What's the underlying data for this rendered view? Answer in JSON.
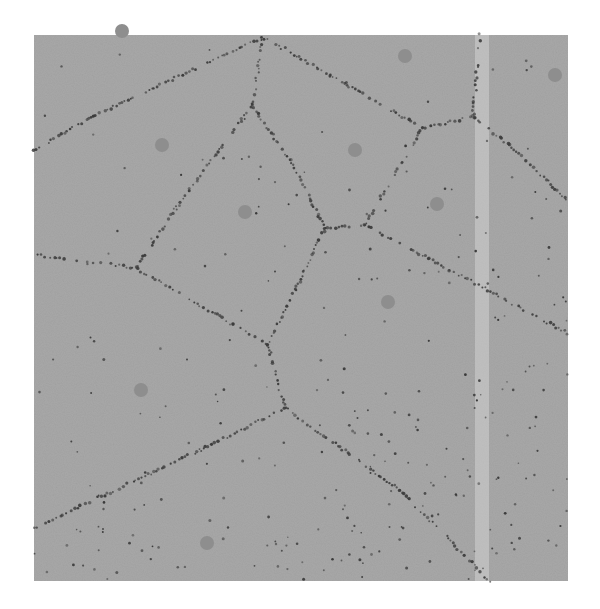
{
  "diagram": {
    "type": "voronoi",
    "background": "#ffffff",
    "panel": {
      "x": 34,
      "y": 35,
      "width": 534,
      "height": 546,
      "fill": "#a8a8a8"
    },
    "edge_color": "#3c3c3c",
    "site_color": "#8e8e8e",
    "site_radius": 7,
    "streak": {
      "x": 475,
      "width": 14,
      "color": "#d2d2d2"
    },
    "sites": [
      [
        122,
        31
      ],
      [
        162,
        145
      ],
      [
        245,
        212
      ],
      [
        355,
        150
      ],
      [
        405,
        56
      ],
      [
        555,
        75
      ],
      [
        437,
        204
      ],
      [
        388,
        302
      ],
      [
        141,
        390
      ],
      [
        207,
        543
      ]
    ],
    "edges": [
      [
        [
          34,
          150
        ],
        [
          90,
          118
        ],
        [
          262,
          37
        ]
      ],
      [
        [
          262,
          37
        ],
        [
          258,
          72
        ],
        [
          252,
          105
        ]
      ],
      [
        [
          252,
          105
        ],
        [
          290,
          160
        ],
        [
          325,
          228
        ]
      ],
      [
        [
          252,
          105
        ],
        [
          175,
          210
        ],
        [
          136,
          268
        ]
      ],
      [
        [
          262,
          37
        ],
        [
          330,
          75
        ],
        [
          422,
          128
        ]
      ],
      [
        [
          422,
          128
        ],
        [
          473,
          117
        ]
      ],
      [
        [
          473,
          117
        ],
        [
          480,
          35
        ]
      ],
      [
        [
          473,
          117
        ],
        [
          510,
          145
        ],
        [
          567,
          200
        ]
      ],
      [
        [
          325,
          228
        ],
        [
          365,
          225
        ],
        [
          422,
          128
        ]
      ],
      [
        [
          325,
          228
        ],
        [
          295,
          290
        ],
        [
          268,
          345
        ]
      ],
      [
        [
          365,
          225
        ],
        [
          450,
          270
        ],
        [
          567,
          333
        ]
      ],
      [
        [
          34,
          255
        ],
        [
          80,
          260
        ],
        [
          136,
          268
        ]
      ],
      [
        [
          136,
          268
        ],
        [
          200,
          305
        ],
        [
          268,
          345
        ]
      ],
      [
        [
          268,
          345
        ],
        [
          285,
          408
        ]
      ],
      [
        [
          285,
          408
        ],
        [
          200,
          450
        ],
        [
          34,
          528
        ]
      ],
      [
        [
          285,
          408
        ],
        [
          400,
          490
        ],
        [
          490,
          581
        ]
      ]
    ]
  }
}
